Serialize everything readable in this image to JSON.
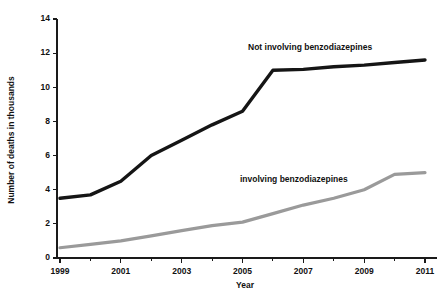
{
  "chart_data": {
    "type": "line",
    "title": "",
    "xlabel": "Year",
    "ylabel": "Number of deaths in thousands",
    "xlim": [
      1999,
      2011
    ],
    "ylim": [
      0,
      14
    ],
    "grid": false,
    "legend_position": "inline-annotation",
    "x": [
      1999,
      2000,
      2001,
      2002,
      2003,
      2004,
      2005,
      2006,
      2007,
      2008,
      2009,
      2010,
      2011
    ],
    "y_ticks": [
      0,
      2,
      4,
      6,
      8,
      10,
      12,
      14
    ],
    "y_tick_labels": [
      "0",
      "2",
      "4",
      "6",
      "8",
      "10",
      "12",
      "14"
    ],
    "x_ticks_major": [
      1999,
      2001,
      2003,
      2005,
      2007,
      2009,
      2011
    ],
    "x_tick_labels": [
      "1999",
      "2001",
      "2003",
      "2005",
      "2007",
      "2009",
      "2011"
    ],
    "x_ticks_minor": [
      2000,
      2002,
      2004,
      2006,
      2008,
      2010
    ],
    "series": [
      {
        "name": "Not involving benzodiazepines",
        "color": "#151515",
        "label_text": "Not involving benzodiazepines",
        "values": [
          3.5,
          3.7,
          4.5,
          6.0,
          6.9,
          7.8,
          8.6,
          11.0,
          11.05,
          11.2,
          11.3,
          11.45,
          11.6
        ]
      },
      {
        "name": "Involving benzodiazepines",
        "color": "#9a9a9a",
        "label_text": "involving benzodiazepines",
        "values": [
          0.6,
          0.8,
          1.0,
          1.3,
          1.6,
          1.9,
          2.1,
          2.6,
          3.1,
          3.5,
          4.0,
          4.9,
          5.0
        ]
      }
    ]
  },
  "annotations": {
    "upper_label": "Not involving benzodiazepines",
    "lower_label": "involving benzodiazepines"
  }
}
